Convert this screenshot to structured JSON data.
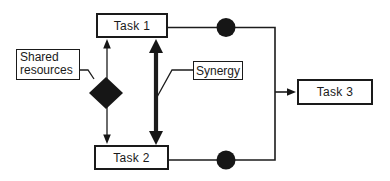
{
  "diagram": {
    "colors": {
      "line": "#1c1c1c",
      "solid_shape": "#161616",
      "node_fill": "#ffffff",
      "background": "#ffffff"
    },
    "nodes": {
      "task1": {
        "label": "Task 1"
      },
      "task2": {
        "label": "Task 2"
      },
      "task3": {
        "label": "Task 3"
      }
    },
    "annotations": {
      "shared_resources": {
        "label": "Shared resources"
      },
      "synergy": {
        "label": "Synergy"
      }
    },
    "shapes": {
      "diamond": "shared-resources-diamond-icon",
      "junction_top": "filled-circle-icon",
      "junction_bottom": "filled-circle-icon",
      "thin_arrow": "double-headed-thin-arrow",
      "thick_arrow": "double-headed-thick-arrow",
      "output_arrow": "right-arrow-into-task3"
    }
  }
}
